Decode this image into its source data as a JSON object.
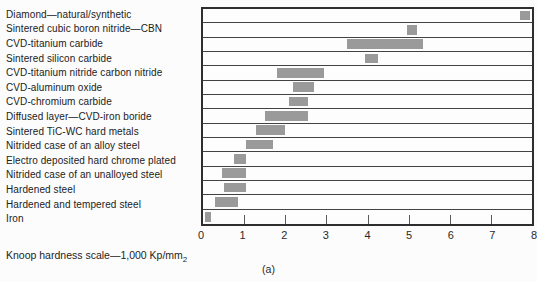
{
  "figure": {
    "panel_label": "(a)"
  },
  "chart_data": {
    "type": "bar",
    "subtype": "horizontal-range-bars",
    "title": "",
    "xlabel_main": "Knoop hardness scale—1,000 Kp/mm",
    "xlabel_sub": "2",
    "ylabel": "",
    "xlim": [
      0,
      8
    ],
    "xticks": [
      0,
      1,
      2,
      3,
      4,
      5,
      6,
      7,
      8
    ],
    "grid": "horizontal row dividers, outer frame, inner tick marks on bottom edge",
    "legend_position": "none",
    "bar_color": "#9a9a9a",
    "categories": [
      "Diamond—natural/synthetic",
      "Sintered cubic boron nitride—CBN",
      "CVD-titanium carbide",
      "Sintered silicon carbide",
      "CVD-titanium nitride carbon nitride",
      "CVD-aluminum oxide",
      "CVD-chromium carbide",
      "Diffused layer—CVD-iron boride",
      "Sintered TiC-WC hard metals",
      "Nitrided case of an alloy steel",
      "Electro deposited hard chrome plated",
      "Nitrided case of an unalloyed steel",
      "Hardened steel",
      "Hardened and tempered steel",
      "Iron"
    ],
    "ranges": [
      [
        7.7,
        7.95
      ],
      [
        4.95,
        5.2
      ],
      [
        3.5,
        5.35
      ],
      [
        3.95,
        4.25
      ],
      [
        1.8,
        2.95
      ],
      [
        2.2,
        2.7
      ],
      [
        2.1,
        2.55
      ],
      [
        1.5,
        2.55
      ],
      [
        1.3,
        2.0
      ],
      [
        1.05,
        1.7
      ],
      [
        0.75,
        1.05
      ],
      [
        0.45,
        1.05
      ],
      [
        0.5,
        1.05
      ],
      [
        0.3,
        0.85
      ],
      [
        0.05,
        0.2
      ]
    ]
  }
}
